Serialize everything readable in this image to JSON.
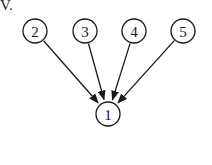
{
  "option_label_fragment": "V.",
  "diagram": {
    "type": "directed-graph",
    "nodes": [
      {
        "id": "2",
        "label": "2",
        "x": 35,
        "y": 31
      },
      {
        "id": "3",
        "label": "3",
        "x": 85,
        "y": 31
      },
      {
        "id": "4",
        "label": "4",
        "x": 134,
        "y": 31
      },
      {
        "id": "5",
        "label": "5",
        "x": 183,
        "y": 31
      },
      {
        "id": "1",
        "label": "1",
        "x": 108,
        "y": 114
      }
    ],
    "edges": [
      {
        "from": "2",
        "to": "1"
      },
      {
        "from": "3",
        "to": "1"
      },
      {
        "from": "4",
        "to": "1"
      },
      {
        "from": "5",
        "to": "1"
      }
    ]
  }
}
